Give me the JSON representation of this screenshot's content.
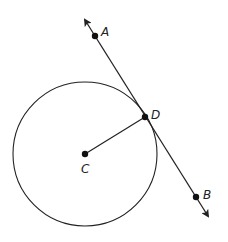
{
  "diagram": {
    "type": "circle-tangent-line",
    "colors": {
      "stroke": "#222222",
      "point": "#111111",
      "background": "#ffffff"
    },
    "circle": {
      "center_label": "C",
      "cx": 85,
      "cy": 154,
      "r": 72
    },
    "points": [
      {
        "label": "A",
        "x": 95,
        "y": 36
      },
      {
        "label": "D",
        "x": 145,
        "y": 117
      },
      {
        "label": "C",
        "x": 85,
        "y": 154
      },
      {
        "label": "B",
        "x": 196,
        "y": 197
      }
    ],
    "line": {
      "through": [
        "A",
        "B"
      ],
      "tangent_at": "D",
      "arrows": "both"
    },
    "segments": [
      {
        "from": "C",
        "to": "D",
        "kind": "radius"
      }
    ]
  }
}
